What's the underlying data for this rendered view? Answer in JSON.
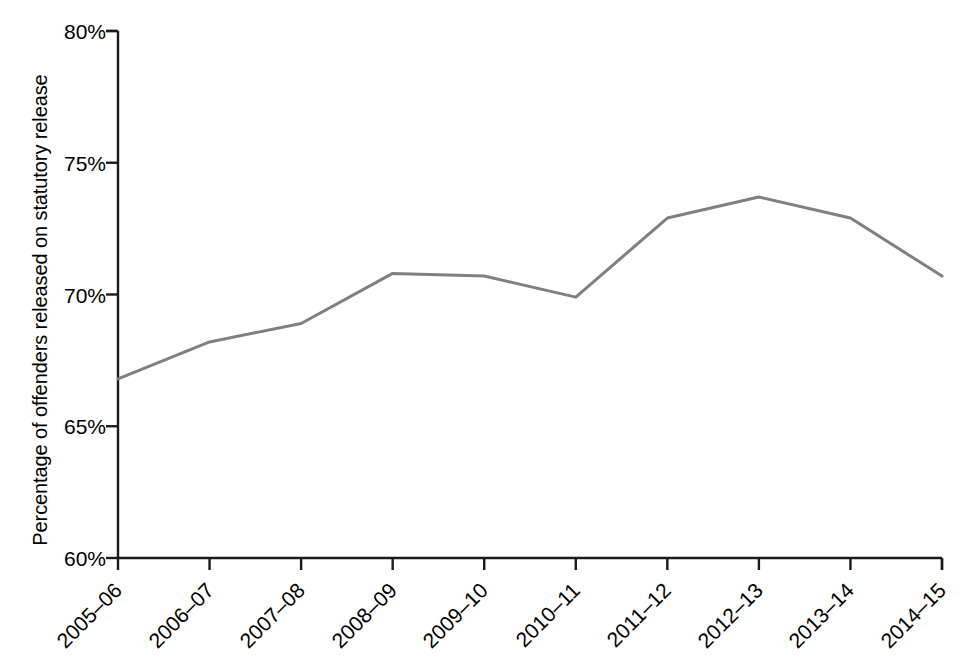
{
  "chart_data": {
    "type": "line",
    "title": "",
    "subtitle": "",
    "xlabel": "",
    "ylabel": "Percentage of offenders released on statutory release",
    "categories": [
      "2005–06",
      "2006–07",
      "2007–08",
      "2008–09",
      "2009–10",
      "2010–11",
      "2011–12",
      "2012–13",
      "2013–14",
      "2014–15"
    ],
    "series": [
      {
        "name": "Percentage of offenders released on statutory release",
        "values": [
          66.8,
          68.2,
          68.9,
          70.8,
          70.7,
          69.9,
          72.9,
          73.7,
          72.9,
          70.7
        ],
        "color": "#808080"
      }
    ],
    "ylim": [
      60,
      80
    ],
    "ytick_values": [
      60,
      65,
      70,
      75,
      80
    ],
    "ytick_labels": [
      "60%",
      "65%",
      "70%",
      "75%",
      "80%"
    ],
    "grid": false,
    "legend": "none",
    "background": "#ffffff",
    "axis_color": "#1a1a1a",
    "line_width": 3
  },
  "axes": {
    "y_title": "Percentage of offenders released on statutory release"
  }
}
